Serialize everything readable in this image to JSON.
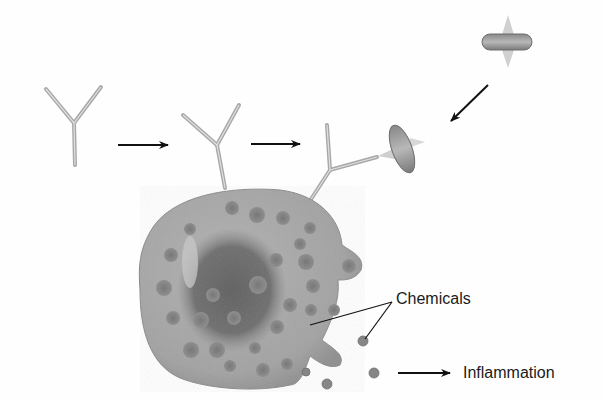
{
  "diagram": {
    "type": "biology-process-illustration",
    "labels": {
      "chemicals": "Chemicals",
      "inflammation": "Inflammation"
    },
    "elements": [
      {
        "name": "free-antibody",
        "shape": "Y"
      },
      {
        "name": "antibody-attaching-to-cell",
        "shape": "Y"
      },
      {
        "name": "bound-antibody-with-allergen",
        "shape": "Y"
      },
      {
        "name": "allergen-free",
        "shape": "disc-with-spikes"
      },
      {
        "name": "allergen-bound",
        "shape": "disc-with-spikes"
      },
      {
        "name": "mast-cell",
        "shape": "granular-sphere"
      },
      {
        "name": "released-granules",
        "count": 4
      }
    ],
    "arrows": [
      {
        "from": "free-antibody",
        "to": "antibody-attaching-to-cell"
      },
      {
        "from": "antibody-attaching-to-cell",
        "to": "bound-antibody-with-allergen"
      },
      {
        "from": "allergen-free",
        "to": "bound-antibody-with-allergen"
      },
      {
        "from": "released-granules",
        "to": "inflammation"
      }
    ],
    "colors": {
      "background": "#fefefe",
      "cell": "#a8a8a8",
      "cell_dark": "#6e6e6e",
      "granule": "#808080",
      "antibody": "#b0b0b0",
      "arrow": "#111111"
    }
  }
}
